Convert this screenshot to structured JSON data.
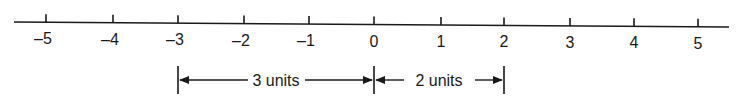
{
  "diagram": {
    "type": "number-line",
    "range": [
      -5,
      5
    ],
    "ticks": [
      {
        "value": -5,
        "label": "-5",
        "x": 46
      },
      {
        "value": -4,
        "label": "-4",
        "x": 113
      },
      {
        "value": -3,
        "label": "-3",
        "x": 178
      },
      {
        "value": -2,
        "label": "-2",
        "x": 244
      },
      {
        "value": -1,
        "label": "-1",
        "x": 309
      },
      {
        "value": 0,
        "label": "0",
        "x": 374
      },
      {
        "value": 1,
        "label": "1",
        "x": 441
      },
      {
        "value": 2,
        "label": "2",
        "x": 504
      },
      {
        "value": 3,
        "label": "3",
        "x": 570
      },
      {
        "value": 4,
        "label": "4",
        "x": 634
      },
      {
        "value": 5,
        "label": "5",
        "x": 698
      }
    ],
    "intervals": [
      {
        "from": -3,
        "to": 0,
        "label": "3 units"
      },
      {
        "from": 0,
        "to": 2,
        "label": "2 units"
      }
    ],
    "color": "#1a1a1a"
  }
}
